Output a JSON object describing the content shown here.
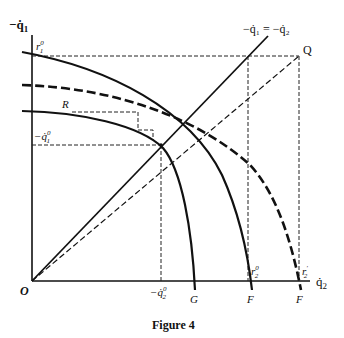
{
  "figure": {
    "caption": "Figure 4",
    "axes": {
      "y_label": "−q̇",
      "y_label_sub": "1",
      "x_label": "q̇",
      "x_label_sub": "2",
      "origin_label": "O"
    },
    "diagonal_label": "−q̇₁ = −q̇₂",
    "point_labels": {
      "Q": "Q",
      "R": "R"
    },
    "ticks": {
      "r1_0": {
        "base": "r",
        "sup": "0",
        "sub": "1"
      },
      "minus_q1_0": {
        "base": "−q̇",
        "sup": "0",
        "sub": "1"
      },
      "minus_q2_0": {
        "base": "−q̇",
        "sup": "0",
        "sub": "2"
      },
      "r2_0": {
        "base": "r",
        "sup": "0",
        "sub": "2"
      },
      "r2_prime": {
        "base": "r",
        "sup": "′",
        "sub": "2"
      }
    },
    "curve_labels": {
      "G": "G",
      "F_inner": "F",
      "F_outer": "F"
    }
  }
}
